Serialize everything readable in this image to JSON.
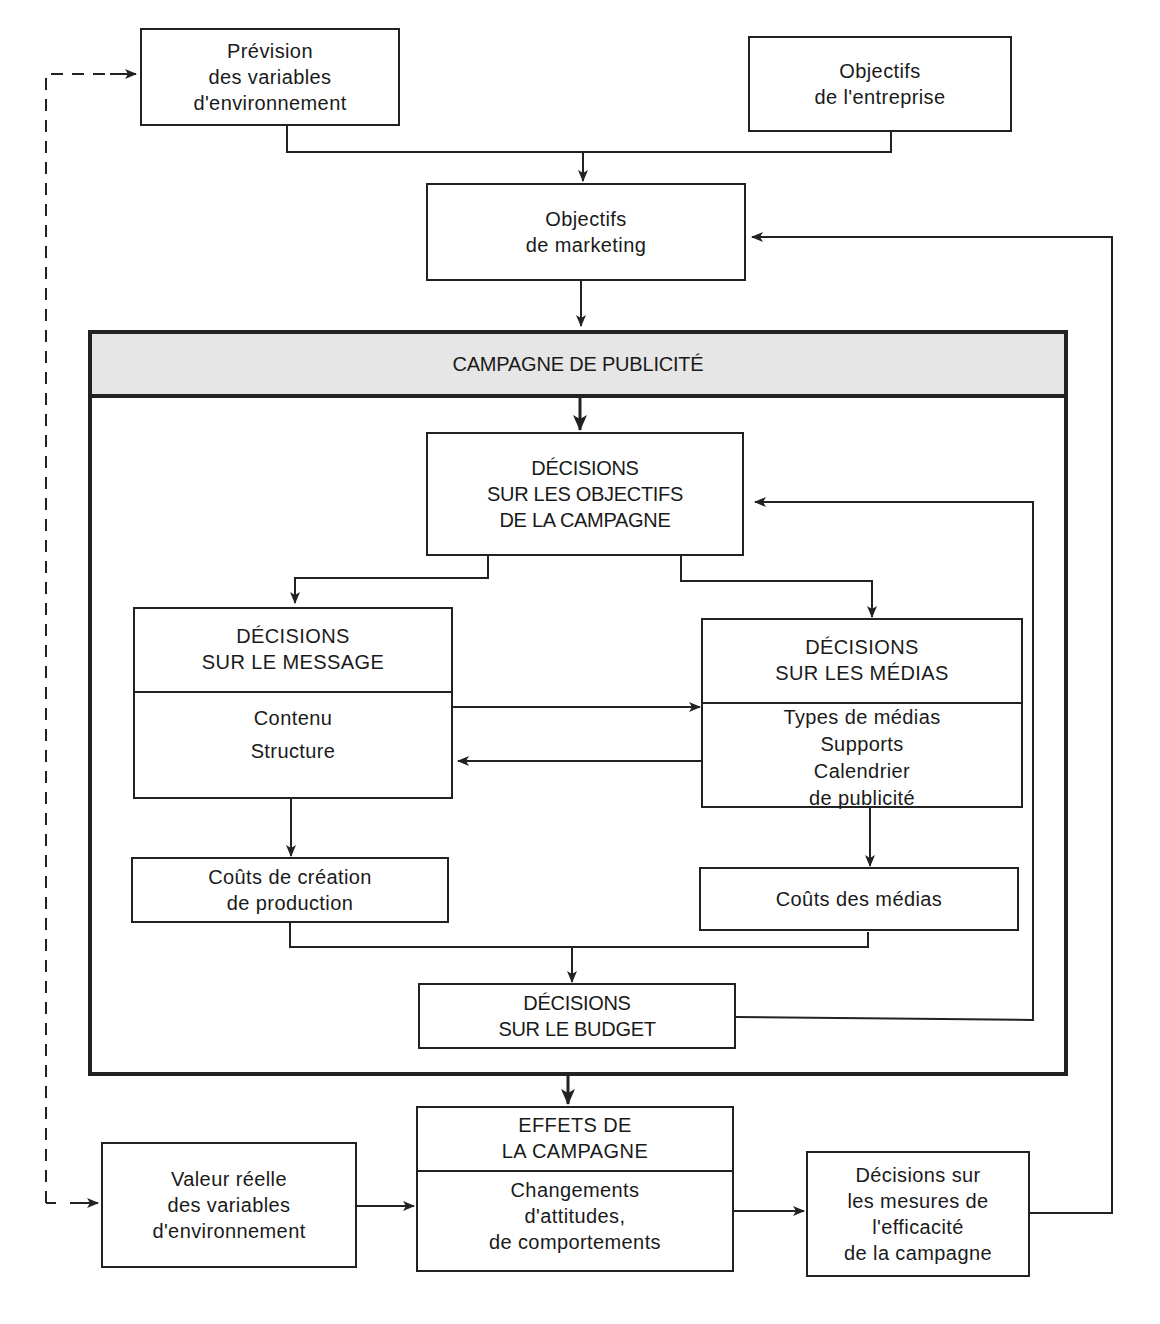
{
  "diagram": {
    "top": {
      "forecast_env": {
        "lines": [
          "Prévision",
          "des variables",
          "d'environnement"
        ]
      },
      "company_goals": {
        "lines": [
          "Objectifs",
          "de l'entreprise"
        ]
      },
      "marketing_goals": {
        "lines": [
          "Objectifs",
          "de marketing"
        ]
      }
    },
    "campaign": {
      "title": "CAMPAGNE DE PUBLICITÉ",
      "objectives": {
        "lines": [
          "DÉCISIONS",
          "SUR LES OBJECTIFS",
          "DE LA CAMPAGNE"
        ]
      },
      "message": {
        "head": [
          "DÉCISIONS",
          "SUR LE MESSAGE"
        ],
        "body": [
          "Contenu",
          "Structure"
        ]
      },
      "media": {
        "head": [
          "DÉCISIONS",
          "SUR LES MÉDIAS"
        ],
        "body": [
          "Types de médias",
          "Supports",
          "Calendrier",
          "de publicité"
        ]
      },
      "creation_costs": {
        "lines": [
          "Coûts de création",
          "de production"
        ]
      },
      "media_costs": {
        "lines": [
          "Coûts des médias"
        ]
      },
      "budget": {
        "lines": [
          "DÉCISIONS",
          "SUR LE BUDGET"
        ]
      }
    },
    "bottom": {
      "actual_env": {
        "lines": [
          "Valeur réelle",
          "des variables",
          "d'environnement"
        ]
      },
      "effects": {
        "head": [
          "EFFETS DE",
          "LA CAMPAGNE"
        ],
        "body": [
          "Changements",
          "d'attitudes,",
          "de comportements"
        ]
      },
      "measures": {
        "lines": [
          "Décisions sur",
          "les mesures de",
          "l'efficacité",
          "de la campagne"
        ]
      }
    },
    "colors": {
      "ink": "#222222",
      "band": "#e6e6e6",
      "paper": "#ffffff"
    }
  }
}
